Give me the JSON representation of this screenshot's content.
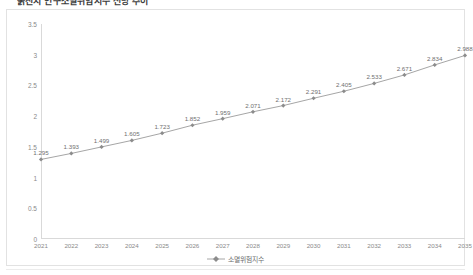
{
  "chart_title": "욹진시 인구소멸위험지수 전망 추이",
  "legend": {
    "label": "소멸위험지수",
    "symbol": "line-marker-icon",
    "color": "#a6a6a6"
  },
  "axes": {
    "y_ticks": [
      "0",
      "0.5",
      "1",
      "1.5",
      "2",
      "2.5",
      "3",
      "3.5"
    ],
    "x_ticks": [
      "2021",
      "2022",
      "2023",
      "2024",
      "2025",
      "2026",
      "2027",
      "2028",
      "2029",
      "2030",
      "2031",
      "2032",
      "2033",
      "2034",
      "2035"
    ]
  },
  "chart_data": {
    "type": "line",
    "title": "욹진시 인구소멸위험지수 전망 추이",
    "xlabel": "",
    "ylabel": "",
    "ylim": [
      0,
      3.5
    ],
    "ytick_step": 0.5,
    "grid": false,
    "legend_position": "bottom",
    "marker": "diamond",
    "data_labels": true,
    "line_color": "#a6a6a6",
    "marker_color": "#8c8c8c",
    "categories": [
      "2021",
      "2022",
      "2023",
      "2024",
      "2025",
      "2026",
      "2027",
      "2028",
      "2029",
      "2030",
      "2031",
      "2032",
      "2033",
      "2034",
      "2035"
    ],
    "series": [
      {
        "name": "소멸위험지수",
        "values": [
          1.295,
          1.393,
          1.499,
          1.605,
          1.723,
          1.852,
          1.959,
          2.071,
          2.172,
          2.291,
          2.405,
          2.533,
          2.671,
          2.834,
          2.988
        ],
        "labels": [
          "1.295",
          "1.393",
          "1.499",
          "1.605",
          "1.723",
          "1.852",
          "1.959",
          "2.071",
          "2.172",
          "2.291",
          "2.405",
          "2.533",
          "2.671",
          "2.834",
          "2.988"
        ]
      }
    ]
  }
}
